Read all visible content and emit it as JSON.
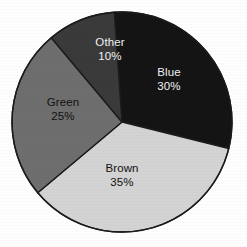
{
  "chart_data": {
    "type": "pie",
    "title": "",
    "xlabel": "",
    "ylabel": "",
    "legend": "none",
    "labels_inside_slices": true,
    "categories": [
      "Blue",
      "Brown",
      "Green",
      "Other"
    ],
    "values": [
      30,
      35,
      25,
      10
    ],
    "unit": "%",
    "slices": [
      {
        "name": "Blue",
        "value": 30,
        "percent_text": "30%",
        "fill": "#141414",
        "text_color": "#f2f2f2",
        "label_x": 169,
        "label_y": 80
      },
      {
        "name": "Brown",
        "value": 35,
        "percent_text": "35%",
        "fill": "#d3d3d3",
        "text_color": "#111111",
        "label_x": 122,
        "label_y": 176
      },
      {
        "name": "Green",
        "value": 25,
        "percent_text": "25%",
        "fill": "#6e6e6e",
        "text_color": "#111111",
        "label_x": 63,
        "label_y": 110
      },
      {
        "name": "Other",
        "value": 10,
        "percent_text": "10%",
        "fill": "#3a3a3a",
        "text_color": "#f2f2f2",
        "label_x": 110,
        "label_y": 50
      }
    ],
    "geometry": {
      "center_x": 122,
      "center_y": 122,
      "radius": 110,
      "start_angle_deg": -94,
      "direction": "clockwise"
    },
    "style": {
      "background": "#ffffff",
      "outline": "#1b1b1b",
      "outline_width": 1.4
    }
  }
}
